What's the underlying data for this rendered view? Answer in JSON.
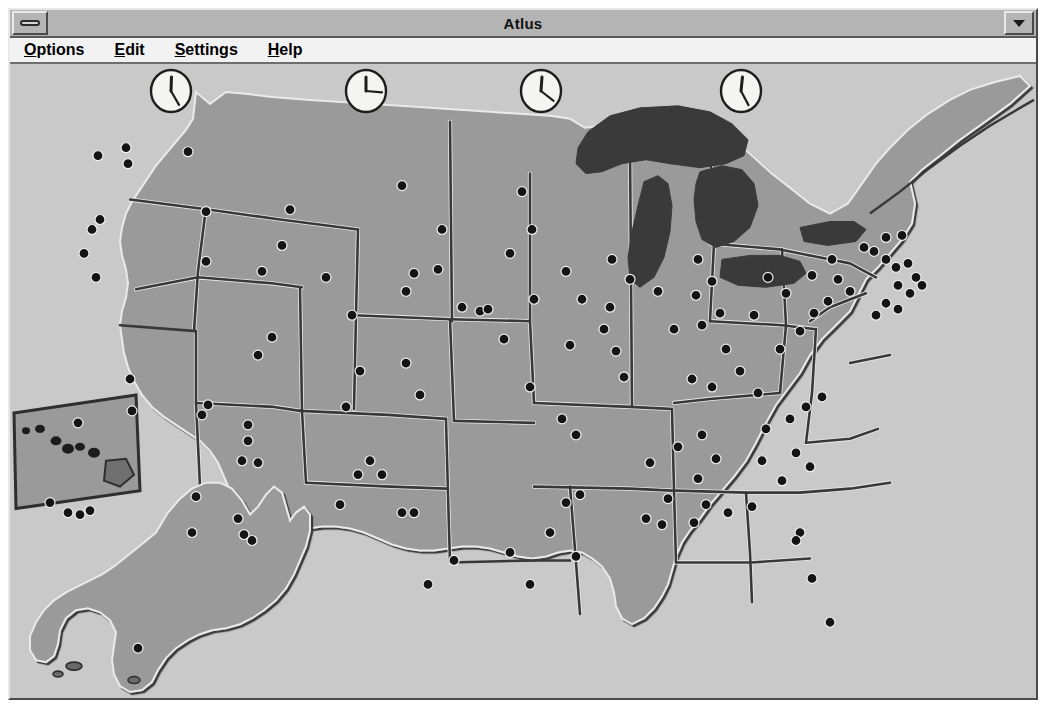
{
  "window": {
    "title": "Atlus",
    "system_box_icon": "minimize-bar-icon",
    "minimize_button_icon": "chevron-down-icon"
  },
  "menubar": {
    "items": [
      {
        "label": "Options",
        "accel": "O",
        "rest": "ptions"
      },
      {
        "label": "Edit",
        "accel": "E",
        "rest": "dit"
      },
      {
        "label": "Settings",
        "accel": "S",
        "rest": "ettings"
      },
      {
        "label": "Help",
        "accel": "H",
        "rest": "elp"
      }
    ]
  },
  "map": {
    "region": "United States",
    "colors": {
      "background": "#c9c9c9",
      "land": "#9a9a9a",
      "lakes": "#3a3a3a",
      "border_shadow": "#383838",
      "border_highlight": "#eaeaea",
      "city_dot": "#141414"
    },
    "insets": [
      {
        "name": "hawaii-inset",
        "style": "slanted-box"
      },
      {
        "name": "alaska-inset",
        "style": "outline"
      }
    ]
  },
  "clocks": [
    {
      "name": "clock-pacific",
      "zone": "Pacific",
      "hour_deg": 2,
      "minute_deg": 150,
      "x": 138,
      "y": 4
    },
    {
      "name": "clock-mountain",
      "zone": "Mountain",
      "hour_deg": 0,
      "minute_deg": 95,
      "x": 333,
      "y": 4
    },
    {
      "name": "clock-central",
      "zone": "Central",
      "hour_deg": 4,
      "minute_deg": 128,
      "x": 508,
      "y": 4
    },
    {
      "name": "clock-eastern",
      "zone": "Eastern",
      "hour_deg": 6,
      "minute_deg": 152,
      "x": 708,
      "y": 4
    }
  ]
}
